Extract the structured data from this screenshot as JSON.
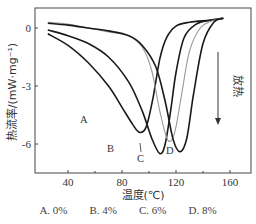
{
  "chart_data": {
    "type": "line",
    "title": "",
    "xlabel": "温度(℃)",
    "ylabel": "热流率/(mW·mg⁻¹)",
    "xlim": [
      20,
      165
    ],
    "ylim": [
      -7.5,
      1.0
    ],
    "xticks": [
      40,
      80,
      120,
      160
    ],
    "yticks": [
      0,
      -3,
      -6
    ],
    "grid": false,
    "annotation": {
      "text": "放热",
      "arrow": "down"
    },
    "series": [
      {
        "name": "A",
        "label": "A. 0%",
        "color": "#1a1a1a",
        "x": [
          25,
          40,
          55,
          70,
          80,
          88,
          93,
          98,
          103,
          108,
          113,
          120,
          130,
          145,
          155
        ],
        "y": [
          -0.3,
          -0.9,
          -1.8,
          -3.0,
          -4.1,
          -5.0,
          -5.4,
          -5.1,
          -3.6,
          -1.6,
          -0.5,
          0.1,
          0.3,
          0.4,
          0.5
        ]
      },
      {
        "name": "B",
        "label": "B. 4%",
        "color": "#1a1a1a",
        "x": [
          25,
          40,
          55,
          70,
          85,
          95,
          102,
          108,
          112,
          116,
          120,
          126,
          135,
          145,
          155
        ],
        "y": [
          -0.1,
          -0.4,
          -0.8,
          -1.5,
          -2.8,
          -4.3,
          -5.7,
          -6.5,
          -6.0,
          -4.3,
          -2.3,
          -0.5,
          0.2,
          0.4,
          0.5
        ]
      },
      {
        "name": "C",
        "label": "C. 6%",
        "color": "#999999",
        "x": [
          25,
          40,
          55,
          70,
          85,
          95,
          102,
          108,
          114,
          119,
          124,
          130,
          138,
          148,
          155
        ],
        "y": [
          0.3,
          0.2,
          0.0,
          -0.2,
          -0.4,
          -1.0,
          -2.2,
          -4.3,
          -5.8,
          -5.4,
          -3.5,
          -1.2,
          0.0,
          0.4,
          0.5
        ]
      },
      {
        "name": "D",
        "label": "D. 8%",
        "color": "#1a1a1a",
        "x": [
          25,
          40,
          55,
          70,
          85,
          95,
          105,
          112,
          118,
          123,
          128,
          133,
          140,
          148,
          155
        ],
        "y": [
          0.25,
          0.15,
          0.0,
          -0.15,
          -0.4,
          -0.9,
          -2.0,
          -3.8,
          -5.8,
          -6.4,
          -5.7,
          -3.4,
          -0.8,
          0.3,
          0.5
        ]
      }
    ]
  },
  "axes": {
    "x_title": "温度(℃)",
    "y_title": "热流率/(mW·mg⁻¹)",
    "x_ticks": [
      "40",
      "80",
      "120",
      "160"
    ],
    "y_ticks": [
      "0",
      "-3",
      "-6"
    ]
  },
  "annotation": {
    "text": "放热"
  },
  "curve_labels": {
    "A": "A",
    "B": "B",
    "C": "C",
    "D": "D"
  },
  "legend": [
    "A. 0%",
    "B. 4%",
    "C. 6%",
    "D. 8%"
  ]
}
